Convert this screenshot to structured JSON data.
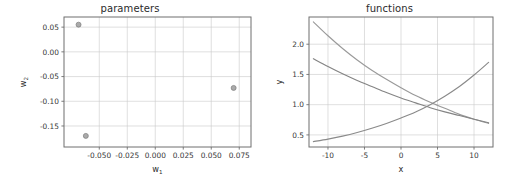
{
  "figure": {
    "background": "#ffffff",
    "width": 519,
    "height": 186
  },
  "panels": {
    "left": {
      "title": "parameters",
      "xlabel": "w",
      "xlabel_sub": "1",
      "ylabel": "w",
      "ylabel_sub": "2"
    },
    "right": {
      "title": "functions",
      "xlabel": "x",
      "ylabel": "y"
    }
  },
  "chart_data": [
    {
      "type": "scatter",
      "title": "parameters",
      "xlabel": "w1",
      "ylabel": "w2",
      "grid": true,
      "legend": null,
      "xlim": [
        -0.0815,
        0.0855
      ],
      "ylim": [
        -0.1925,
        0.0705
      ],
      "xticks": [
        -0.05,
        -0.025,
        0.0,
        0.025,
        0.05,
        0.075
      ],
      "xticklabels": [
        "-0.050",
        "-0.025",
        "0.000",
        "0.025",
        "0.050",
        "0.075"
      ],
      "yticks": [
        0.05,
        0.0,
        -0.05,
        -0.1,
        -0.15
      ],
      "yticklabels": [
        "0.05",
        "0.00",
        "-0.05",
        "-0.10",
        "-0.15"
      ],
      "marker_color": "#8d8d8d",
      "marker_size": 5,
      "points": [
        {
          "x": -0.0685,
          "y": 0.055
        },
        {
          "x": -0.062,
          "y": -0.17
        },
        {
          "x": 0.07,
          "y": -0.073
        }
      ]
    },
    {
      "type": "line",
      "title": "functions",
      "xlabel": "x",
      "ylabel": "y",
      "grid": true,
      "legend": null,
      "xlim": [
        -12.6,
        12.6
      ],
      "ylim": [
        0.3,
        2.45
      ],
      "xticks": [
        -10,
        -5,
        0,
        5,
        10
      ],
      "xticklabels": [
        "-10",
        "-5",
        "0",
        "5",
        "10"
      ],
      "yticks": [
        0.5,
        1.0,
        1.5,
        2.0
      ],
      "yticklabels": [
        "0.5",
        "1.0",
        "1.5",
        "2.0"
      ],
      "x": [
        -12,
        -10,
        -8,
        -6,
        -4,
        -2,
        0,
        2,
        4,
        6,
        8,
        10,
        12
      ],
      "series": [
        {
          "name": "decay-steep",
          "color": "#9a9a9a",
          "values": [
            2.37,
            2.14,
            1.93,
            1.74,
            1.57,
            1.42,
            1.28,
            1.15,
            1.04,
            0.94,
            0.84,
            0.76,
            0.69
          ]
        },
        {
          "name": "decay-shallow",
          "color": "#848484",
          "values": [
            1.76,
            1.63,
            1.51,
            1.4,
            1.3,
            1.2,
            1.11,
            1.03,
            0.95,
            0.88,
            0.82,
            0.76,
            0.7
          ]
        },
        {
          "name": "growth",
          "color": "#8a8a8a",
          "values": [
            0.39,
            0.43,
            0.48,
            0.54,
            0.61,
            0.69,
            0.78,
            0.88,
            1.0,
            1.14,
            1.3,
            1.49,
            1.7
          ]
        }
      ]
    }
  ]
}
